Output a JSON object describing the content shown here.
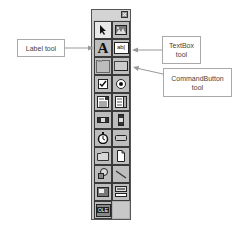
{
  "toolbox": {
    "close_icon": "close-icon",
    "tools": [
      {
        "name": "pointer",
        "icon": "pointer-icon",
        "selected": true
      },
      {
        "name": "picturebox",
        "icon": "picturebox-icon"
      },
      {
        "name": "label",
        "icon": "label-icon",
        "glyph": "A"
      },
      {
        "name": "textbox",
        "icon": "textbox-icon",
        "glyph": "ab|"
      },
      {
        "name": "frame",
        "icon": "frame-icon",
        "glyph": "xv"
      },
      {
        "name": "commandbutton",
        "icon": "commandbutton-icon"
      },
      {
        "name": "checkbox",
        "icon": "checkbox-icon"
      },
      {
        "name": "optionbutton",
        "icon": "optionbutton-icon"
      },
      {
        "name": "combobox",
        "icon": "combobox-icon"
      },
      {
        "name": "listbox",
        "icon": "listbox-icon"
      },
      {
        "name": "hscrollbar",
        "icon": "hscrollbar-icon"
      },
      {
        "name": "vscrollbar",
        "icon": "vscrollbar-icon"
      },
      {
        "name": "timer",
        "icon": "timer-icon"
      },
      {
        "name": "drivelistbox",
        "icon": "drivelistbox-icon"
      },
      {
        "name": "dirlistbox",
        "icon": "dirlistbox-icon"
      },
      {
        "name": "filelistbox",
        "icon": "filelistbox-icon"
      },
      {
        "name": "shape",
        "icon": "shape-icon"
      },
      {
        "name": "line",
        "icon": "line-icon"
      },
      {
        "name": "image",
        "icon": "image-icon"
      },
      {
        "name": "data",
        "icon": "data-icon"
      },
      {
        "name": "ole",
        "icon": "ole-icon",
        "glyph": "OLE"
      }
    ]
  },
  "callouts": {
    "label_tool": "Label tool",
    "textbox_tool_line1": "TextBox",
    "textbox_tool_line2": "tool",
    "commandbutton_tool_line1": "CommandButton",
    "commandbutton_tool_line2": "tool"
  }
}
